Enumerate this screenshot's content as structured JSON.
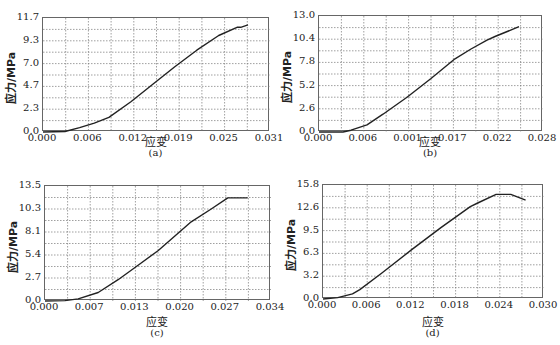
{
  "chart_data": [
    {
      "id": "a",
      "type": "line",
      "caption": "(a)",
      "xlabel": "应变",
      "ylabel": "应力/MPa",
      "xticks": [
        "0.000",
        "0.006",
        "0.012",
        "0.019",
        "0.025",
        "0.031"
      ],
      "yticks": [
        "0.0",
        "2.3",
        "4.7",
        "7.0",
        "9.3",
        "11.7"
      ],
      "xlim": [
        0,
        0.031
      ],
      "ylim": [
        0,
        11.7
      ],
      "grid": true,
      "x": [
        0.0,
        0.003,
        0.005,
        0.007,
        0.009,
        0.012,
        0.015,
        0.018,
        0.021,
        0.024,
        0.0265,
        0.027,
        0.028
      ],
      "y": [
        0.0,
        0.05,
        0.45,
        0.9,
        1.5,
        3.1,
        4.9,
        6.7,
        8.4,
        9.9,
        10.75,
        10.75,
        11.0
      ]
    },
    {
      "id": "b",
      "type": "line",
      "caption": "(b)",
      "xlabel": "应变",
      "ylabel": "应力/MPa",
      "xticks": [
        "0.000",
        "0.006",
        "0.001",
        "0.017",
        "0.022",
        "0.028"
      ],
      "yticks": [
        "0.0",
        "2.6",
        "5.2",
        "7.8",
        "10.4",
        "13.0"
      ],
      "xlim": [
        0,
        0.028
      ],
      "ylim": [
        0,
        13.0
      ],
      "grid": true,
      "x": [
        0.0,
        0.003,
        0.004,
        0.006,
        0.008,
        0.011,
        0.014,
        0.017,
        0.019,
        0.021,
        0.022,
        0.025
      ],
      "y": [
        0.0,
        0.0,
        0.2,
        0.8,
        2.0,
        3.9,
        6.0,
        8.2,
        9.3,
        10.3,
        10.7,
        11.8
      ]
    },
    {
      "id": "c",
      "type": "line",
      "caption": "(c)",
      "xlabel": "应变",
      "ylabel": "应力/MPa",
      "xticks": [
        "0.000",
        "0.007",
        "0.013",
        "0.020",
        "0.027",
        "0.034"
      ],
      "yticks": [
        "0.0",
        "2.7",
        "5.4",
        "8.1",
        "10.3",
        "13.5"
      ],
      "xlim": [
        0,
        0.034
      ],
      "ylim": [
        0,
        13.5
      ],
      "grid": true,
      "x": [
        0.0,
        0.003,
        0.005,
        0.008,
        0.011,
        0.014,
        0.017,
        0.0195,
        0.022,
        0.025,
        0.0275,
        0.0305
      ],
      "y": [
        0.0,
        0.05,
        0.25,
        1.0,
        2.5,
        4.2,
        5.9,
        7.6,
        9.3,
        10.8,
        12.1,
        12.1
      ]
    },
    {
      "id": "d",
      "type": "line",
      "caption": "(d)",
      "xlabel": "应变",
      "ylabel": "应力/MPa",
      "xticks": [
        "0.000",
        "0.006",
        "0.012",
        "0.018",
        "0.024",
        "0.030"
      ],
      "yticks": [
        "0.0",
        "3.2",
        "6.3",
        "9.5",
        "12.6",
        "15.8"
      ],
      "xlim": [
        0,
        0.03
      ],
      "ylim": [
        0,
        15.8
      ],
      "grid": true,
      "x": [
        0.0,
        0.002,
        0.004,
        0.005,
        0.008,
        0.012,
        0.016,
        0.02,
        0.021,
        0.0235,
        0.0255,
        0.0275
      ],
      "y": [
        0.0,
        0.2,
        0.7,
        1.3,
        3.6,
        6.8,
        9.9,
        12.8,
        13.3,
        14.5,
        14.5,
        13.7
      ]
    }
  ],
  "style": {
    "line_color": "#222222",
    "grid_color": "#777777",
    "frame_color": "#666666"
  }
}
